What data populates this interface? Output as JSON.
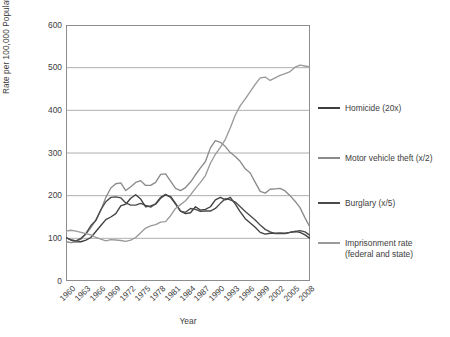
{
  "chart_data": {
    "type": "line",
    "title": "",
    "xlabel": "Year",
    "ylabel": "Rate per 100,000 Population",
    "xlim": [
      1960,
      2009
    ],
    "ylim": [
      0,
      600
    ],
    "grid": true,
    "legend_position": "right",
    "y_ticks": [
      0,
      100,
      200,
      300,
      400,
      500,
      600
    ],
    "x_ticks": [
      "1960",
      "1963",
      "1966",
      "1969",
      "1972",
      "1975",
      "1978",
      "1981",
      "1984",
      "1987",
      "1990",
      "1993",
      "1996",
      "1999",
      "2002",
      "2005",
      "2008"
    ],
    "x": [
      1960,
      1961,
      1962,
      1963,
      1964,
      1965,
      1966,
      1967,
      1968,
      1969,
      1970,
      1971,
      1972,
      1973,
      1974,
      1975,
      1976,
      1977,
      1978,
      1979,
      1980,
      1981,
      1982,
      1983,
      1984,
      1985,
      1986,
      1987,
      1988,
      1989,
      1990,
      1991,
      1992,
      1993,
      1994,
      1995,
      1996,
      1997,
      1998,
      1999,
      2000,
      2001,
      2002,
      2003,
      2004,
      2005,
      2006,
      2007,
      2008,
      2009
    ],
    "series": [
      {
        "name": "Homicide (20x)",
        "color": "#3f3f3f",
        "values": [
          102,
          96,
          92,
          92,
          96,
          102,
          116,
          130,
          144,
          150,
          158,
          176,
          180,
          194,
          202,
          192,
          174,
          176,
          180,
          194,
          202,
          198,
          182,
          164,
          158,
          160,
          174,
          166,
          168,
          174,
          190,
          196,
          190,
          196,
          180,
          162,
          146,
          136,
          126,
          114,
          110,
          112,
          112,
          112,
          112,
          114,
          116,
          114,
          108,
          100
        ]
      },
      {
        "name": "Motor vehicle theft (x/2)",
        "color": "#8b8b8b",
        "values": [
          92,
          90,
          92,
          98,
          110,
          125,
          143,
          166,
          196,
          218,
          228,
          230,
          212,
          221,
          231,
          235,
          224,
          224,
          231,
          250,
          251,
          234,
          217,
          212,
          219,
          232,
          249,
          265,
          280,
          312,
          329,
          325,
          315,
          301,
          292,
          280,
          263,
          253,
          231,
          210,
          206,
          215,
          216,
          217,
          211,
          200,
          187,
          172,
          148,
          126
        ]
      },
      {
        "name": "Burglary (x/5)",
        "color": "#4a4a4a",
        "values": [
          101,
          97,
          94,
          100,
          111,
          130,
          142,
          167,
          186,
          196,
          197,
          195,
          183,
          178,
          178,
          182,
          177,
          173,
          181,
          196,
          203,
          196,
          180,
          164,
          161,
          170,
          168,
          163,
          164,
          164,
          170,
          182,
          193,
          190,
          185,
          174,
          163,
          153,
          143,
          131,
          121,
          115,
          111,
          112,
          111,
          114,
          116,
          118,
          115,
          107
        ]
      },
      {
        "name": "Imprisonment rate (federal and state)",
        "color": "#9a9a9a",
        "values": [
          117,
          119,
          117,
          114,
          111,
          108,
          102,
          98,
          94,
          97,
          96,
          95,
          93,
          96,
          102,
          113,
          124,
          129,
          132,
          138,
          139,
          153,
          170,
          179,
          188,
          202,
          217,
          231,
          247,
          276,
          297,
          313,
          332,
          359,
          389,
          411,
          427,
          444,
          461,
          476,
          478,
          470,
          476,
          482,
          486,
          491,
          501,
          506,
          504,
          502
        ]
      }
    ]
  },
  "axes": {
    "y_axis_title": "Rate per 100,000 Population",
    "x_axis_title": "Year"
  },
  "legend": {
    "items": [
      {
        "label": "Homicide (20x)",
        "color": "#3f3f3f"
      },
      {
        "label": "Motor vehicle theft (x/2)",
        "color": "#8b8b8b"
      },
      {
        "label": "Burglary (x/5)",
        "color": "#4a4a4a"
      },
      {
        "label": "Imprisonment rate\n(federal and state)",
        "color": "#9a9a9a"
      }
    ]
  },
  "style": {
    "grid_color": "#9a9a9a",
    "frame_color": "#8d8d8d",
    "text_color": "#3d3d3d",
    "background": "#ffffff"
  }
}
